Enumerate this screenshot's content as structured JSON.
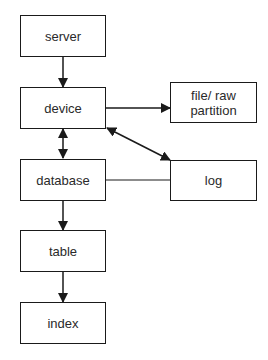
{
  "nodes": {
    "server": {
      "label": "server"
    },
    "device": {
      "label": "device"
    },
    "database": {
      "label": "database"
    },
    "table": {
      "label": "table"
    },
    "index": {
      "label": "index"
    },
    "file_raw_partition": {
      "label_line1": "file/ raw",
      "label_line2": "partition"
    },
    "log": {
      "label": "log"
    }
  },
  "edges": [
    {
      "from": "server",
      "to": "device",
      "type": "arrow"
    },
    {
      "from": "device",
      "to": "database",
      "type": "double-arrow"
    },
    {
      "from": "database",
      "to": "table",
      "type": "arrow"
    },
    {
      "from": "table",
      "to": "index",
      "type": "arrow"
    },
    {
      "from": "device",
      "to": "file_raw_partition",
      "type": "arrow"
    },
    {
      "from": "device",
      "to": "log",
      "type": "double-arrow"
    },
    {
      "from": "database",
      "to": "log",
      "type": "line"
    }
  ],
  "colors": {
    "stroke": "#1a1a1a",
    "text": "#2a2a2a",
    "background": "#ffffff"
  }
}
